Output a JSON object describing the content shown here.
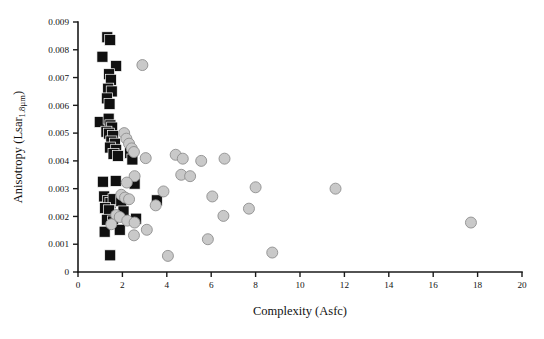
{
  "figure": {
    "background_color": "#ffffff",
    "width": 544,
    "height": 339
  },
  "axes": {
    "x_title": "Complexity (Asfc)",
    "y_title_main": "Anisotropy (Lsar",
    "y_title_sub": "1.8µm",
    "y_title_close": ")",
    "x_tick_labels": [
      "0",
      "2",
      "4",
      "6",
      "8",
      "10",
      "12",
      "14",
      "16",
      "18",
      "20"
    ],
    "y_tick_labels": [
      "0",
      "0.001",
      "0.002",
      "0.003",
      "0.004",
      "0.005",
      "0.006",
      "0.007",
      "0.008",
      "0.009"
    ]
  },
  "legend": {
    "series_1_name": "black-squares",
    "series_2_name": "gray-circles"
  },
  "chart_data": {
    "type": "scatter",
    "title": "",
    "xlabel": "Complexity (Asfc)",
    "ylabel": "Anisotropy (Lsar 1.8µm)",
    "xlim": [
      0,
      20
    ],
    "ylim": [
      0,
      0.009
    ],
    "xticks": [
      0,
      2,
      4,
      6,
      8,
      10,
      12,
      14,
      16,
      18,
      20
    ],
    "yticks": [
      0,
      0.001,
      0.002,
      0.003,
      0.004,
      0.005,
      0.006,
      0.007,
      0.008,
      0.009
    ],
    "grid": false,
    "legend_position": "none",
    "series": [
      {
        "name": "black-squares",
        "marker": "square",
        "color": "#101010",
        "edge_color": "#ffffff",
        "marker_size": 11,
        "points": [
          [
            1.32,
            0.00845
          ],
          [
            1.45,
            0.00835
          ],
          [
            1.1,
            0.00775
          ],
          [
            1.72,
            0.00742
          ],
          [
            1.4,
            0.00712
          ],
          [
            1.48,
            0.00692
          ],
          [
            1.36,
            0.0066
          ],
          [
            1.52,
            0.0065
          ],
          [
            1.3,
            0.00625
          ],
          [
            1.42,
            0.00605
          ],
          [
            0.98,
            0.0054
          ],
          [
            1.38,
            0.00552
          ],
          [
            1.46,
            0.00528
          ],
          [
            1.54,
            0.0052
          ],
          [
            1.28,
            0.00505
          ],
          [
            1.4,
            0.00498
          ],
          [
            1.58,
            0.0049
          ],
          [
            1.5,
            0.0047
          ],
          [
            1.66,
            0.00462
          ],
          [
            1.44,
            0.00448
          ],
          [
            1.72,
            0.0044
          ],
          [
            1.6,
            0.00425
          ],
          [
            1.8,
            0.00418
          ],
          [
            2.35,
            0.00428
          ],
          [
            2.45,
            0.00405
          ],
          [
            1.12,
            0.00325
          ],
          [
            1.7,
            0.00328
          ],
          [
            2.55,
            0.00318
          ],
          [
            1.18,
            0.00272
          ],
          [
            1.35,
            0.00255
          ],
          [
            1.46,
            0.00248
          ],
          [
            1.6,
            0.00262
          ],
          [
            1.95,
            0.00255
          ],
          [
            1.22,
            0.0023
          ],
          [
            1.4,
            0.00222
          ],
          [
            2.05,
            0.00218
          ],
          [
            3.55,
            0.00258
          ],
          [
            1.3,
            0.00188
          ],
          [
            1.58,
            0.00182
          ],
          [
            2.62,
            0.00192
          ],
          [
            1.2,
            0.00145
          ],
          [
            1.88,
            0.00152
          ],
          [
            1.45,
            0.0006
          ]
        ]
      },
      {
        "name": "gray-circles",
        "marker": "circle",
        "color": "#c9c9c9",
        "edge_color": "#8e8e8e",
        "marker_size": 11,
        "points": [
          [
            2.9,
            0.00745
          ],
          [
            2.08,
            0.005
          ],
          [
            2.18,
            0.0048
          ],
          [
            2.3,
            0.00462
          ],
          [
            2.42,
            0.00445
          ],
          [
            2.52,
            0.00432
          ],
          [
            3.05,
            0.0041
          ],
          [
            4.4,
            0.00422
          ],
          [
            4.72,
            0.00408
          ],
          [
            5.55,
            0.004
          ],
          [
            6.6,
            0.00408
          ],
          [
            2.55,
            0.00345
          ],
          [
            2.2,
            0.00322
          ],
          [
            4.65,
            0.0035
          ],
          [
            5.05,
            0.00345
          ],
          [
            8.0,
            0.00305
          ],
          [
            11.6,
            0.003
          ],
          [
            1.95,
            0.00278
          ],
          [
            2.12,
            0.00268
          ],
          [
            2.3,
            0.00262
          ],
          [
            3.85,
            0.0029
          ],
          [
            6.05,
            0.00272
          ],
          [
            3.5,
            0.0024
          ],
          [
            7.7,
            0.00228
          ],
          [
            1.72,
            0.00205
          ],
          [
            1.88,
            0.00198
          ],
          [
            2.22,
            0.00185
          ],
          [
            2.55,
            0.00178
          ],
          [
            6.55,
            0.00202
          ],
          [
            17.7,
            0.00178
          ],
          [
            1.5,
            0.00172
          ],
          [
            3.1,
            0.00152
          ],
          [
            2.52,
            0.00132
          ],
          [
            5.85,
            0.00118
          ],
          [
            8.75,
            0.0007
          ],
          [
            4.05,
            0.00058
          ]
        ]
      }
    ]
  }
}
